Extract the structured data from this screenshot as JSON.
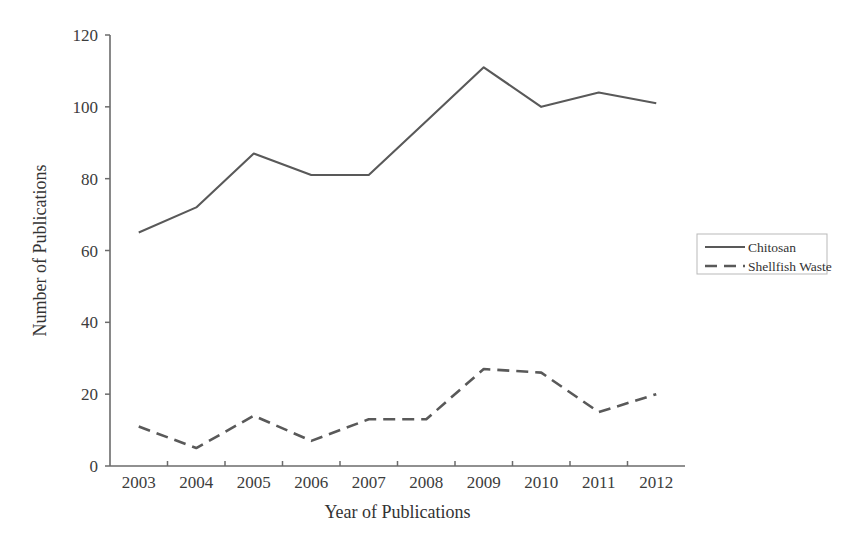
{
  "chart_data": {
    "type": "line",
    "title": "",
    "subtitle": "",
    "xlabel": "Year of Publications",
    "ylabel": "Number of Publications",
    "categories": [
      "2003",
      "2004",
      "2005",
      "2006",
      "2007",
      "2008",
      "2009",
      "2010",
      "2011",
      "2012"
    ],
    "x": [
      2003,
      2004,
      2005,
      2006,
      2007,
      2008,
      2009,
      2010,
      2011,
      2012
    ],
    "series": [
      {
        "name": "Chitosan",
        "style": "solid",
        "color": "#595959",
        "values": [
          65,
          72,
          87,
          81,
          81,
          96,
          111,
          100,
          104,
          101
        ]
      },
      {
        "name": "Shellfish Waste",
        "style": "dashed",
        "color": "#595959",
        "values": [
          11,
          5,
          14,
          7,
          13,
          13,
          27,
          26,
          15,
          20
        ]
      }
    ],
    "ylim": [
      0,
      120
    ],
    "y_ticks": [
      0,
      20,
      40,
      60,
      80,
      100,
      120
    ],
    "y_tick_labels": [
      "0",
      "20",
      "40",
      "60",
      "80",
      "100",
      "120"
    ],
    "grid": false,
    "legend_position": "right",
    "legend_entries": [
      {
        "label": "Chitosan",
        "style": "solid"
      },
      {
        "label": "Shellfish Waste",
        "style": "dashed"
      }
    ]
  },
  "colors": {
    "background": "#ffffff",
    "axis": "#6b6b6b",
    "text": "#333333",
    "series_chitosan": "#595959",
    "series_shellfish": "#595959",
    "legend_border": "#b9b9b9"
  }
}
